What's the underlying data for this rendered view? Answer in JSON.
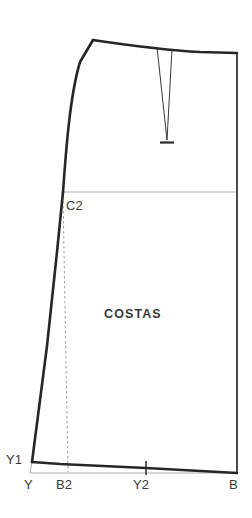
{
  "drawing": {
    "type": "sewing-pattern-block",
    "piece_label": "COSTAS",
    "canvas": {
      "width": 252,
      "height": 518
    },
    "colors": {
      "background": "#ffffff",
      "outline": "#262626",
      "construction": "#7a7a7a",
      "dashed": "#8a8a8a",
      "dart": "#2b2b2b",
      "text": "#3a3a3a"
    },
    "strokes": {
      "outline_width": 2.6,
      "construction_width": 0.7,
      "dashed_width": 0.8,
      "dart_width": 0.9
    }
  },
  "points": {
    "C2": {
      "label": "C2",
      "x": 63,
      "y": 192,
      "text_x": 66,
      "text_y": 199
    },
    "Y1": {
      "label": "Y1",
      "x": 32,
      "y": 462,
      "text_x": 6,
      "text_y": 456
    },
    "Y": {
      "label": "Y",
      "x": 30,
      "y": 473,
      "text_x": 24,
      "text_y": 479
    },
    "B2": {
      "label": "B2",
      "x": 68,
      "y": 473,
      "text_x": 57,
      "text_y": 479
    },
    "Y2": {
      "label": "Y2",
      "x": 146,
      "y": 470,
      "text_x": 134,
      "text_y": 479
    },
    "B": {
      "label": "B",
      "x": 237,
      "y": 473,
      "text_x": 230,
      "text_y": 479
    }
  },
  "piece_text": {
    "label": "COSTAS",
    "x": 104,
    "y": 313
  },
  "paths": {
    "waistline": "M 93 40 C 120 44 160 50 200 52 L 237 53",
    "side_right": "M 237 53 L 237 473",
    "hemline": "M 237 473 L 146 468 L 60 464 L 32 462",
    "side_left_lower": "M 32 462 L 47 346 L 57 252 L 63 192",
    "side_left_upper": "M 63 192 C 66 150 70 95 80 62 L 93 40",
    "hip_line": "M 63 192 L 237 192",
    "baseline": "M 30 473 L 237 473",
    "left_tick": "M 30 473 L 32 462",
    "dashed_vertical": "M 63 196 L 68 472",
    "dart_left": "M 157 47 L 167 140",
    "dart_right": "M 172 49 L 167 140",
    "dart_point_tick": "M 160 142 L 174 142",
    "y2_tick": "M 146 462 L 146 474"
  },
  "legend": {
    "piece_name": "COSTAS",
    "point_labels": [
      "C2",
      "Y1",
      "Y",
      "B2",
      "Y2",
      "B"
    ]
  }
}
